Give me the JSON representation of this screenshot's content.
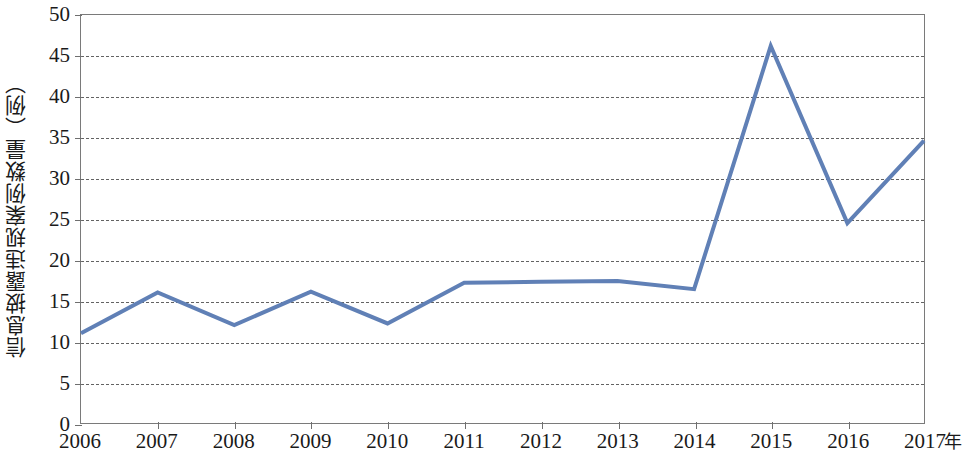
{
  "chart_data": {
    "type": "line",
    "title": "",
    "subtitle": "",
    "xlabel": "年",
    "ylabel": "信息披露违规案例数量（例）",
    "categories": [
      "2006",
      "2007",
      "2008",
      "2009",
      "2010",
      "2011",
      "2012",
      "2013",
      "2014",
      "2015",
      "2016",
      "2017"
    ],
    "x": [
      2006,
      2007,
      2008,
      2009,
      2010,
      2011,
      2012,
      2013,
      2014,
      2015,
      2016,
      2017
    ],
    "values": [
      11.0,
      16.0,
      12.0,
      16.1,
      12.2,
      17.2,
      17.3,
      17.4,
      16.4,
      46.2,
      24.5,
      34.6
    ],
    "series": [
      {
        "name": "信息披露违规案例数量",
        "values": [
          11.0,
          16.0,
          12.0,
          16.1,
          12.2,
          17.2,
          17.3,
          17.4,
          16.4,
          46.2,
          24.5,
          34.6
        ],
        "color": "#6080b6"
      }
    ],
    "ylim": [
      0,
      50
    ],
    "yticks": [
      0,
      5,
      10,
      15,
      20,
      25,
      30,
      35,
      40,
      45,
      50
    ],
    "ytick_labels": [
      "0",
      "5",
      "10",
      "15",
      "20",
      "25",
      "30",
      "35",
      "40",
      "45",
      "50"
    ],
    "xlim": [
      2006,
      2017
    ],
    "grid": "horizontal-dashed",
    "legend": "none",
    "line_color": "#6080b6",
    "line_width": 4,
    "markers": "none",
    "axis_color": "#7a7a7a",
    "grid_color": "#636363",
    "background": "#ffffff"
  }
}
